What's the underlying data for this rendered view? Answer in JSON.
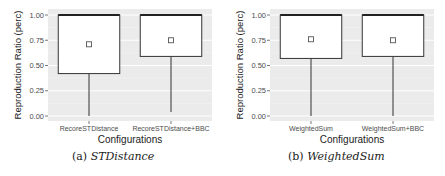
{
  "chart_data": [
    {
      "type": "box",
      "caption_label": "(a)",
      "caption_name": "STDistance",
      "xlabel": "Configurations",
      "ylabel": "Reproduction Ratio (perc)",
      "ylim": [
        0,
        1
      ],
      "yticks": [
        "0.00",
        "0.25",
        "0.50",
        "0.75",
        "1.00"
      ],
      "grid": true,
      "categories": [
        "RecoreSTDistance",
        "RecoreSTDistance+BBC"
      ],
      "boxes": [
        {
          "name": "RecoreSTDistance",
          "min": 0.0,
          "q1": 0.42,
          "median": 1.0,
          "q3": 1.0,
          "max": 1.0,
          "mean": 0.71
        },
        {
          "name": "RecoreSTDistance+BBC",
          "min": 0.04,
          "q1": 0.59,
          "median": 1.0,
          "q3": 1.0,
          "max": 1.0,
          "mean": 0.75
        }
      ]
    },
    {
      "type": "box",
      "caption_label": "(b)",
      "caption_name": "WeightedSum",
      "xlabel": "Configurations",
      "ylabel": "Reproduction Ratio (perc)",
      "ylim": [
        0,
        1
      ],
      "yticks": [
        "0.00",
        "0.25",
        "0.50",
        "0.75",
        "1.00"
      ],
      "grid": true,
      "categories": [
        "WeightedSum",
        "WeightedSum+BBC"
      ],
      "boxes": [
        {
          "name": "WeightedSum",
          "min": 0.0,
          "q1": 0.57,
          "median": 1.0,
          "q3": 1.0,
          "max": 1.0,
          "mean": 0.76
        },
        {
          "name": "WeightedSum+BBC",
          "min": 0.0,
          "q1": 0.59,
          "median": 1.0,
          "q3": 1.0,
          "max": 1.0,
          "mean": 0.75
        }
      ]
    }
  ]
}
